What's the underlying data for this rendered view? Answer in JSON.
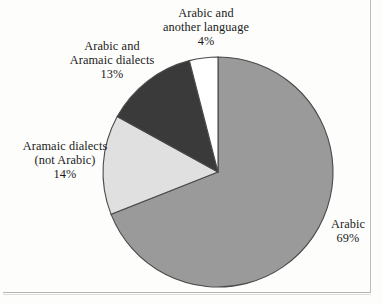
{
  "chart_data": {
    "type": "pie",
    "title": "",
    "subtitle": "",
    "xlabel": "",
    "ylabel": "",
    "legend_position": "none",
    "grid": false,
    "labels_outside": true,
    "start_angle_deg": 0,
    "direction": "clockwise",
    "categories": [
      "Arabic",
      "Arabic and another language",
      "Arabic and Aramaic dialects",
      "Aramaic dialects (not Arabic)"
    ],
    "values": [
      69,
      4,
      13,
      14
    ],
    "value_suffix": "%",
    "colors": [
      "#9a9a9a",
      "#ffffff",
      "#3a3a3a",
      "#e0e0e0"
    ],
    "stroke_color": "#4a4a4a",
    "slices": [
      {
        "name": "Arabic",
        "value": 69,
        "value_text": "69%",
        "color": "#9a9a9a",
        "label_lines": [
          "Arabic"
        ],
        "label_position": "right"
      },
      {
        "name": "Arabic and another language",
        "value": 4,
        "value_text": "4%",
        "color": "#ffffff",
        "label_lines": [
          "Arabic and",
          "another language"
        ],
        "label_position": "top"
      },
      {
        "name": "Arabic and Aramaic dialects",
        "value": 13,
        "value_text": "13%",
        "color": "#3a3a3a",
        "label_lines": [
          "Arabic and",
          "Aramaic dialects"
        ],
        "label_position": "upper-left"
      },
      {
        "name": "Aramaic dialects (not Arabic)",
        "value": 14,
        "value_text": "14%",
        "color": "#e0e0e0",
        "label_lines": [
          "Aramaic dialects",
          "(not Arabic)"
        ],
        "label_position": "left"
      }
    ]
  },
  "labels": {
    "arabic_another": {
      "line1": "Arabic and",
      "line2": "another language",
      "pct": "4%"
    },
    "arabic_aramaic": {
      "line1": "Arabic and",
      "line2": "Aramaic dialects",
      "pct": "13%"
    },
    "aramaic_not_arabic": {
      "line1": "Aramaic dialects",
      "line2": "(not Arabic)",
      "pct": "14%"
    },
    "arabic": {
      "line1": "Arabic",
      "pct": "69%"
    }
  },
  "colors": {
    "slice_arabic": "#9a9a9a",
    "slice_arabic_another": "#ffffff",
    "slice_arabic_aramaic": "#3a3a3a",
    "slice_aramaic_only": "#e0e0e0",
    "outline": "#4a4a4a",
    "page_background": "#fdfdfc",
    "text": "#1a1a1a"
  }
}
